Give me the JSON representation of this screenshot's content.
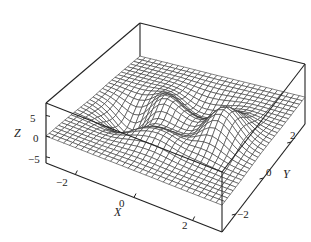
{
  "chart_data": {
    "type": "surface-mesh",
    "title": "",
    "function": "peaks(x,y)",
    "xlabel": "X",
    "ylabel": "Y",
    "zlabel": "Z",
    "xlim": [
      -3,
      3
    ],
    "ylim": [
      -3,
      3
    ],
    "zlim": [
      -6.5,
      8
    ],
    "x_ticks": [
      -2,
      0,
      2
    ],
    "y_ticks": [
      -2,
      0,
      2
    ],
    "z_ticks": [
      -5,
      0,
      5
    ],
    "x_tick_labels": [
      "−2",
      "0",
      "2"
    ],
    "y_tick_labels": [
      "−2",
      "0",
      "2"
    ],
    "z_tick_labels": [
      "−5",
      "0",
      "5"
    ],
    "grid_resolution": 30,
    "features": [
      {
        "type": "peak",
        "x": 0,
        "y": 1.6,
        "z": 8.1
      },
      {
        "type": "valley",
        "x": 0.2,
        "y": -1.6,
        "z": -6.5
      },
      {
        "type": "minor-peak",
        "x": -1.3,
        "y": 0,
        "z": 3.8
      },
      {
        "type": "minor-valley",
        "x": -0.5,
        "y": 0.6,
        "z": -3.0
      }
    ],
    "box": true,
    "colors": {
      "mesh_line": "#333333",
      "mesh_face": "#ffffff",
      "box": "#222222"
    }
  },
  "axes": {
    "x_label": "X",
    "y_label": "Y",
    "z_label": "Z",
    "x_ticks": [
      "−2",
      "0",
      "2"
    ],
    "y_ticks": [
      "−2",
      "0",
      "2"
    ],
    "z_ticks": [
      "5",
      "0",
      "−5"
    ]
  }
}
